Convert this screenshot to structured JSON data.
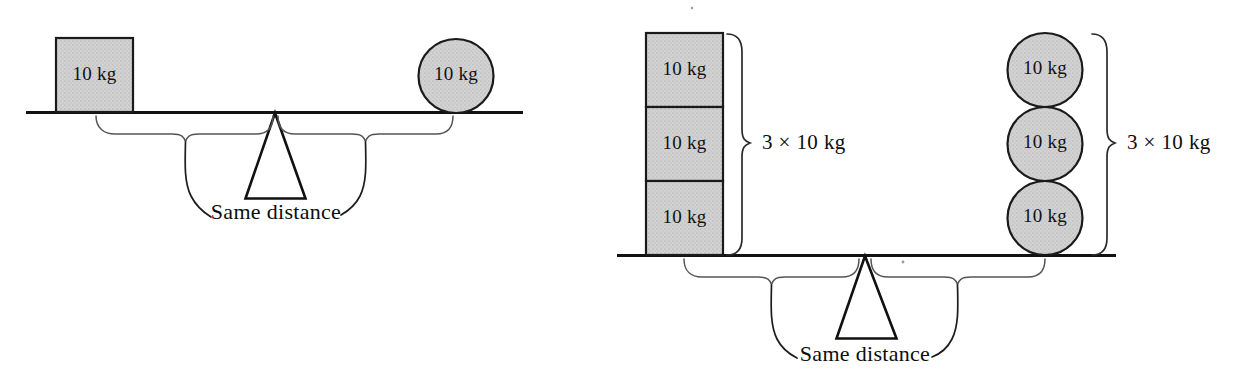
{
  "figure": {
    "background_color": "#ffffff",
    "shape_fill_color": "#cdcdcd",
    "line_color": "#121212"
  },
  "panels": [
    {
      "id": "panel-left",
      "name": "single-weight-balance",
      "left_side": {
        "shape": "square",
        "count": 1,
        "items": [
          {
            "label": "10 kg"
          }
        ]
      },
      "right_side": {
        "shape": "circle",
        "count": 1,
        "items": [
          {
            "label": "10 kg"
          }
        ]
      },
      "distance_label": "Same distance"
    },
    {
      "id": "panel-right",
      "name": "triple-weight-balance",
      "left_side": {
        "shape": "square",
        "count": 3,
        "items": [
          {
            "label": "10 kg"
          },
          {
            "label": "10 kg"
          },
          {
            "label": "10 kg"
          }
        ],
        "total_label": "3 × 10 kg"
      },
      "right_side": {
        "shape": "circle",
        "count": 3,
        "items": [
          {
            "label": "10 kg"
          },
          {
            "label": "10 kg"
          },
          {
            "label": "10 kg"
          }
        ],
        "total_label": "3 × 10 kg"
      },
      "distance_label": "Same distance"
    }
  ]
}
